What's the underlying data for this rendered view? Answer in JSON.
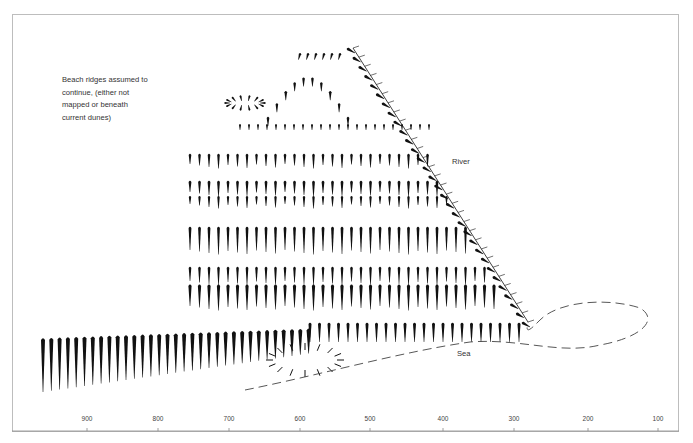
{
  "diagram": {
    "annotation": "Beach ridges assumed to continue, (either not mapped or beneath current dunes)",
    "annotation_lines": [
      "Beach ridges assumed to",
      "continue, (either not",
      "mapped or beneath",
      "current dunes)"
    ],
    "labels": {
      "river": "River",
      "sea": "Sea"
    },
    "axis": {
      "ticks": [
        {
          "label": "900",
          "x": 87
        },
        {
          "label": "800",
          "x": 158
        },
        {
          "label": "700",
          "x": 229
        },
        {
          "label": "600",
          "x": 300
        },
        {
          "label": "500",
          "x": 370
        },
        {
          "label": "400",
          "x": 443
        },
        {
          "label": "300",
          "x": 514
        },
        {
          "label": "200",
          "x": 588
        },
        {
          "label": "100",
          "x": 658
        }
      ]
    },
    "colors": {
      "ink": "#111111",
      "frame": "#bdbdbd",
      "dash": "#444444"
    }
  }
}
